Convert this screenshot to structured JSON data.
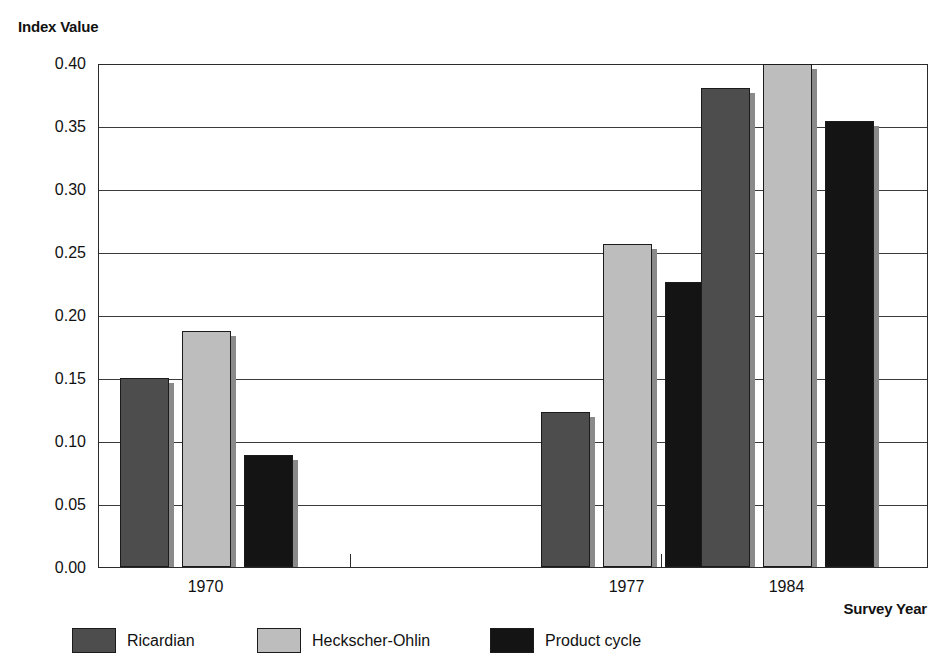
{
  "chart_data": {
    "type": "bar",
    "title": "",
    "ylabel": "Index Value",
    "xlabel": "Survey Year",
    "categories": [
      "1970",
      "1977",
      "1984"
    ],
    "series": [
      {
        "name": "Ricardian",
        "color": "#4d4d4d",
        "values": [
          0.15,
          0.123,
          0.38
        ]
      },
      {
        "name": "Heckscher-Ohlin",
        "color": "#bdbdbd",
        "values": [
          0.187,
          0.256,
          0.399
        ]
      },
      {
        "name": "Product cycle",
        "color": "#141414",
        "values": [
          0.089,
          0.226,
          0.354
        ]
      }
    ],
    "ylim": [
      0.0,
      0.4
    ],
    "yticks": [
      "0.00",
      "0.05",
      "0.10",
      "0.15",
      "0.20",
      "0.25",
      "0.30",
      "0.35",
      "0.40"
    ],
    "ytick_values": [
      0.0,
      0.05,
      0.1,
      0.15,
      0.2,
      0.25,
      0.3,
      0.35,
      0.4
    ],
    "grid": true,
    "grid_axis": "y",
    "legend_position": "bottom",
    "bar_style": "grouped"
  },
  "axes": {
    "y_title": "Index Value",
    "x_title": "Survey Year"
  },
  "legend": {
    "items": [
      {
        "label": "Ricardian"
      },
      {
        "label": "Heckscher-Ohlin"
      },
      {
        "label": "Product cycle"
      }
    ]
  }
}
